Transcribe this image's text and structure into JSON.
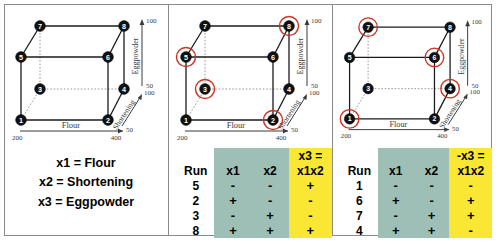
{
  "figure": {
    "legend": {
      "lines": [
        "x1 = Flour",
        "x2 = Shortening",
        "x3 = Eggpowder"
      ]
    },
    "axes": {
      "x_label": "Flour",
      "x_min": "200",
      "x_max": "400",
      "y_label": "Eggpowder",
      "y_min": "50",
      "y_max": "100",
      "z_label": "Shortening",
      "z_min": "50",
      "z_max": "100"
    },
    "cube_vertices": [
      {
        "id": "1",
        "label": "1",
        "x": 17,
        "y": 116
      },
      {
        "id": "2",
        "label": "2",
        "x": 104,
        "y": 116
      },
      {
        "id": "3",
        "label": "3",
        "x": 36,
        "y": 85
      },
      {
        "id": "4",
        "label": "4",
        "x": 120,
        "y": 85
      },
      {
        "id": "5",
        "label": "5",
        "x": 17,
        "y": 53
      },
      {
        "id": "6",
        "label": "6",
        "x": 104,
        "y": 53
      },
      {
        "id": "7",
        "label": "7",
        "x": 36,
        "y": 22
      },
      {
        "id": "8",
        "label": "8",
        "x": 120,
        "y": 22
      }
    ],
    "panels": [
      {
        "name": "panel-full-design",
        "highlighted": [],
        "highlight_color": "#cc3322"
      },
      {
        "name": "panel-fraction-plus",
        "highlighted": [
          "2",
          "3",
          "5",
          "8"
        ],
        "highlight_color": "#cc3322",
        "table": {
          "header_run": "Run",
          "header_x1": "x1",
          "header_x2": "x2",
          "header_x3_top": "x3 =",
          "header_x3_bot": "x1x2",
          "rows": [
            {
              "run": "5",
              "x1": "-",
              "x2": "-",
              "x3": "+"
            },
            {
              "run": "2",
              "x1": "+",
              "x2": "-",
              "x3": "-"
            },
            {
              "run": "3",
              "x1": "-",
              "x2": "+",
              "x3": "-"
            },
            {
              "run": "8",
              "x1": "+",
              "x2": "+",
              "x3": "+"
            }
          ]
        }
      },
      {
        "name": "panel-fraction-minus",
        "highlighted": [
          "1",
          "4",
          "6",
          "7"
        ],
        "highlight_color": "#cc3322",
        "table": {
          "header_run": "Run",
          "header_x1": "x1",
          "header_x2": "x2",
          "header_x3_top": "-x3 =",
          "header_x3_bot": "x1x2",
          "rows": [
            {
              "run": "1",
              "x1": "-",
              "x2": "-",
              "x3": "-"
            },
            {
              "run": "6",
              "x1": "+",
              "x2": "-",
              "x3": "+"
            },
            {
              "run": "7",
              "x1": "-",
              "x2": "+",
              "x3": "+"
            },
            {
              "run": "4",
              "x1": "+",
              "x2": "+",
              "x3": "-"
            }
          ]
        }
      }
    ],
    "colors": {
      "teal": "#9dbfb5",
      "yellow": "#fae733",
      "node": "#111111",
      "highlight": "#cc3322"
    }
  }
}
